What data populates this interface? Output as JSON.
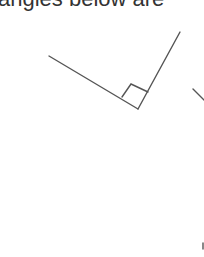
{
  "caption": "angles below are",
  "diagram": {
    "type": "right-angle",
    "stroke_color": "#555555",
    "vertex": [
      138,
      109
    ],
    "ray_ends": [
      [
        49,
        56
      ],
      [
        180,
        32
      ]
    ],
    "right_angle_marker": [
      [
        122,
        97
      ],
      [
        131,
        84
      ],
      [
        148,
        92
      ]
    ],
    "partial_shape_right_edge": [
      [
        193,
        89
      ],
      [
        204,
        100
      ]
    ],
    "partial_mark_bottom_right": [
      203,
      246
    ]
  }
}
